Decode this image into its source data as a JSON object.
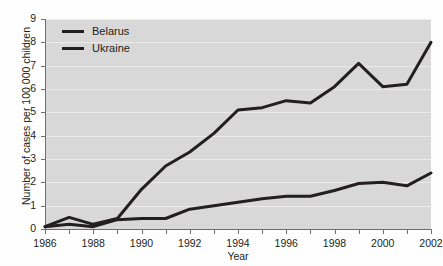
{
  "chart_data": {
    "type": "line",
    "title": "",
    "xlabel": "Year",
    "ylabel": "Number of cases per 100 000 children",
    "xlim": [
      1986,
      2002
    ],
    "ylim": [
      0,
      9
    ],
    "yticks": [
      0,
      1,
      2,
      3,
      4,
      5,
      6,
      7,
      8,
      9
    ],
    "ytick_labels": [
      "0",
      "1",
      "2",
      "3",
      "4",
      "5",
      "6",
      "7",
      "8",
      "9"
    ],
    "xticks": [
      1986,
      1987,
      1988,
      1989,
      1990,
      1991,
      1992,
      1993,
      1994,
      1995,
      1996,
      1997,
      1998,
      1999,
      2000,
      2001,
      2002
    ],
    "xtick_labels_shown": [
      "1986",
      "1988",
      "1990",
      "1992",
      "1994",
      "1996",
      "1998",
      "2000",
      "2002"
    ],
    "x": [
      1986,
      1987,
      1988,
      1989,
      1990,
      1991,
      1992,
      1993,
      1994,
      1995,
      1996,
      1997,
      1998,
      1999,
      2000,
      2001,
      2002
    ],
    "grid": true,
    "grid_axis": "y",
    "legend_position": "top-left",
    "plot_background": "#d9d9d9",
    "line_color": "#231f20",
    "series": [
      {
        "name": "Belarus",
        "values": [
          0.1,
          0.5,
          0.2,
          0.45,
          1.7,
          2.7,
          3.3,
          4.1,
          5.1,
          5.2,
          5.5,
          5.4,
          6.1,
          7.1,
          6.1,
          6.2,
          8.0
        ]
      },
      {
        "name": "Ukraine",
        "values": [
          0.1,
          0.2,
          0.1,
          0.4,
          0.45,
          0.45,
          0.85,
          1.0,
          1.15,
          1.3,
          1.4,
          1.4,
          1.65,
          1.95,
          2.0,
          1.85,
          2.4
        ]
      }
    ]
  },
  "legend": {
    "entries": [
      {
        "label": "Belarus",
        "swatch_name": "legend-swatch-belarus"
      },
      {
        "label": "Ukraine",
        "swatch_name": "legend-swatch-ukraine"
      }
    ]
  },
  "axes": {
    "x_title": "Year",
    "y_title": "Number of cases per 100 000 children"
  }
}
